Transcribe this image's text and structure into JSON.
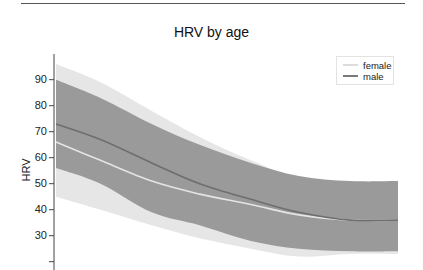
{
  "chart_data": {
    "type": "area",
    "title": "HRV by age",
    "xlabel": "",
    "ylabel": "HRV",
    "ylim": [
      17,
      96
    ],
    "yticks": [
      20,
      30,
      40,
      50,
      60,
      70,
      80,
      90
    ],
    "ytick_labels": [
      "",
      "30",
      "40",
      "50",
      "60",
      "70",
      "80",
      "90"
    ],
    "grid": false,
    "legend_position": "upper right",
    "x_normalized": [
      0,
      0.13,
      0.28,
      0.42,
      0.57,
      0.71,
      0.86,
      1.0
    ],
    "series": [
      {
        "name": "female",
        "color": "#dcdcdc",
        "band_color": "#e6e6e6",
        "values": [
          66,
          59,
          51,
          46,
          42,
          38,
          36,
          36
        ],
        "band_upper": [
          96,
          89,
          78,
          68,
          59,
          52,
          50,
          51
        ],
        "band_lower": [
          45,
          40,
          34,
          29,
          25,
          22,
          23,
          23
        ]
      },
      {
        "name": "male",
        "color": "#808080",
        "band_color": "#9a9a9a",
        "values": [
          73,
          67,
          58,
          50,
          44,
          39,
          36,
          36
        ],
        "band_upper": [
          90,
          83,
          73,
          65,
          58,
          53,
          51,
          51
        ],
        "band_lower": [
          56,
          50,
          39,
          34,
          28,
          25,
          24,
          24
        ]
      }
    ]
  },
  "legend": {
    "items": [
      {
        "label": "female",
        "color": "#dcdcdc"
      },
      {
        "label": "male",
        "color": "#7a7a7a"
      }
    ]
  }
}
